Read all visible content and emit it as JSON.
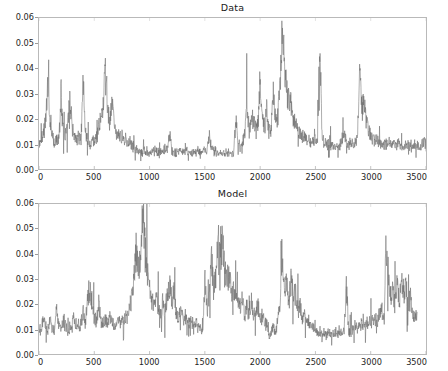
{
  "figure": {
    "background": "#ffffff",
    "line_color": "#6a6a6a",
    "axis_color": "#b9b9b9",
    "tick_label_color": "#232323"
  },
  "chart_data": [
    {
      "type": "line",
      "title": "Data",
      "xlabel": "",
      "ylabel": "",
      "xlim": [
        0,
        3500
      ],
      "ylim": [
        0.0,
        0.06
      ],
      "grid": false,
      "legend": "none",
      "xticks": [
        0,
        500,
        1000,
        1500,
        2000,
        2500,
        3000,
        3500
      ],
      "xtick_labels": [
        "0",
        "500",
        "1000",
        "1500",
        "2000",
        "2500",
        "3000",
        "3500"
      ],
      "yticks": [
        0.0,
        0.01,
        0.02,
        0.03,
        0.04,
        0.05,
        0.06
      ],
      "ytick_labels": [
        "0.00",
        "0.01",
        "0.02",
        "0.03",
        "0.04",
        "0.05",
        "0.06"
      ],
      "series": [
        {
          "name": "Data",
          "color": "#6a6a6a",
          "x": [
            0,
            20,
            40,
            60,
            80,
            100,
            120,
            140,
            160,
            180,
            200,
            220,
            240,
            260,
            280,
            300,
            320,
            340,
            360,
            380,
            400,
            420,
            440,
            460,
            480,
            500,
            520,
            540,
            560,
            580,
            600,
            620,
            640,
            660,
            680,
            700,
            720,
            740,
            760,
            780,
            800,
            820,
            840,
            860,
            880,
            900,
            920,
            940,
            960,
            980,
            1000,
            1020,
            1040,
            1060,
            1080,
            1100,
            1120,
            1140,
            1160,
            1180,
            1200,
            1220,
            1240,
            1260,
            1280,
            1300,
            1320,
            1340,
            1360,
            1380,
            1400,
            1420,
            1440,
            1460,
            1480,
            1500,
            1520,
            1540,
            1560,
            1580,
            1600,
            1620,
            1640,
            1660,
            1680,
            1700,
            1720,
            1740,
            1760,
            1780,
            1800,
            1820,
            1840,
            1860,
            1880,
            1900,
            1920,
            1940,
            1960,
            1980,
            2000,
            2020,
            2040,
            2060,
            2080,
            2100,
            2120,
            2140,
            2160,
            2180,
            2200,
            2220,
            2240,
            2260,
            2280,
            2300,
            2320,
            2340,
            2360,
            2380,
            2400,
            2420,
            2440,
            2460,
            2480,
            2500,
            2520,
            2540,
            2560,
            2580,
            2600,
            2620,
            2640,
            2660,
            2680,
            2700,
            2720,
            2740,
            2760,
            2780,
            2800,
            2820,
            2840,
            2860,
            2880,
            2900,
            2920,
            2940,
            2960,
            2980,
            3000,
            3020,
            3040,
            3060,
            3080,
            3100,
            3120,
            3140,
            3160,
            3180,
            3200,
            3220,
            3240,
            3260,
            3280,
            3300,
            3320,
            3340,
            3360,
            3380,
            3400,
            3420,
            3440,
            3460,
            3480,
            3500
          ],
          "y": [
            0.0095,
            0.011,
            0.0145,
            0.019,
            0.0335,
            0.02,
            0.013,
            0.0105,
            0.0115,
            0.012,
            0.03,
            0.015,
            0.0135,
            0.0185,
            0.03,
            0.0175,
            0.0135,
            0.012,
            0.0125,
            0.0115,
            0.034,
            0.014,
            0.011,
            0.0105,
            0.0115,
            0.0118,
            0.0125,
            0.016,
            0.0215,
            0.026,
            0.038,
            0.0245,
            0.0195,
            0.026,
            0.0175,
            0.015,
            0.014,
            0.013,
            0.0125,
            0.012,
            0.011,
            0.0105,
            0.01,
            0.0085,
            0.0078,
            0.0072,
            0.007,
            0.0068,
            0.0072,
            0.007,
            0.0068,
            0.0072,
            0.0075,
            0.007,
            0.0068,
            0.007,
            0.0075,
            0.008,
            0.0072,
            0.014,
            0.0078,
            0.007,
            0.0068,
            0.0072,
            0.007,
            0.0068,
            0.0072,
            0.0075,
            0.007,
            0.0065,
            0.0068,
            0.007,
            0.0072,
            0.0068,
            0.007,
            0.0075,
            0.008,
            0.013,
            0.0085,
            0.0072,
            0.0068,
            0.0065,
            0.0062,
            0.006,
            0.0062,
            0.0065,
            0.0062,
            0.006,
            0.0058,
            0.02,
            0.0095,
            0.009,
            0.011,
            0.014,
            0.0255,
            0.016,
            0.018,
            0.021,
            0.015,
            0.0175,
            0.0355,
            0.0195,
            0.016,
            0.023,
            0.015,
            0.017,
            0.03,
            0.0185,
            0.021,
            0.033,
            0.057,
            0.039,
            0.031,
            0.028,
            0.0255,
            0.02,
            0.0175,
            0.0155,
            0.014,
            0.013,
            0.0125,
            0.012,
            0.0115,
            0.011,
            0.0105,
            0.0115,
            0.011,
            0.052,
            0.012,
            0.0105,
            0.01,
            0.0098,
            0.0095,
            0.0092,
            0.009,
            0.0095,
            0.0092,
            0.01,
            0.015,
            0.0105,
            0.01,
            0.0098,
            0.01,
            0.0105,
            0.014,
            0.039,
            0.024,
            0.026,
            0.018,
            0.015,
            0.0135,
            0.0125,
            0.0118,
            0.011,
            0.0105,
            0.01,
            0.0098,
            0.01,
            0.0105,
            0.0098,
            0.0095,
            0.01,
            0.0098,
            0.0095,
            0.0092,
            0.009,
            0.0095,
            0.0098,
            0.0092,
            0.009,
            0.0095,
            0.0092,
            0.009,
            0.0095,
            0.01,
            0.011
          ]
        }
      ]
    },
    {
      "type": "line",
      "title": "Model",
      "xlabel": "",
      "ylabel": "",
      "xlim": [
        0,
        3500
      ],
      "ylim": [
        0.0,
        0.06
      ],
      "grid": false,
      "legend": "none",
      "xticks": [
        0,
        500,
        1000,
        1500,
        2000,
        2500,
        3000,
        3500
      ],
      "xtick_labels": [
        "0",
        "500",
        "1000",
        "1500",
        "2000",
        "2500",
        "3000",
        "3500"
      ],
      "yticks": [
        0.0,
        0.01,
        0.02,
        0.03,
        0.04,
        0.05,
        0.06
      ],
      "ytick_labels": [
        "0.00",
        "0.01",
        "0.02",
        "0.03",
        "0.04",
        "0.05",
        "0.06"
      ],
      "series": [
        {
          "name": "Model",
          "color": "#6a6a6a",
          "x": [
            0,
            20,
            40,
            60,
            80,
            100,
            120,
            140,
            160,
            180,
            200,
            220,
            240,
            260,
            280,
            300,
            320,
            340,
            360,
            380,
            400,
            420,
            440,
            460,
            480,
            500,
            520,
            540,
            560,
            580,
            600,
            620,
            640,
            660,
            680,
            700,
            720,
            740,
            760,
            780,
            800,
            820,
            840,
            860,
            880,
            900,
            920,
            940,
            960,
            980,
            1000,
            1020,
            1040,
            1060,
            1080,
            1100,
            1120,
            1140,
            1160,
            1180,
            1200,
            1220,
            1240,
            1260,
            1280,
            1300,
            1320,
            1340,
            1360,
            1380,
            1400,
            1420,
            1440,
            1460,
            1480,
            1500,
            1520,
            1540,
            1560,
            1580,
            1600,
            1620,
            1640,
            1660,
            1680,
            1700,
            1720,
            1740,
            1760,
            1780,
            1800,
            1820,
            1840,
            1860,
            1880,
            1900,
            1920,
            1940,
            1960,
            1980,
            2000,
            2020,
            2040,
            2060,
            2080,
            2100,
            2120,
            2140,
            2160,
            2180,
            2200,
            2220,
            2240,
            2260,
            2280,
            2300,
            2320,
            2340,
            2360,
            2380,
            2400,
            2420,
            2440,
            2460,
            2480,
            2500,
            2520,
            2540,
            2560,
            2580,
            2600,
            2620,
            2640,
            2660,
            2680,
            2700,
            2720,
            2740,
            2760,
            2780,
            2800,
            2820,
            2840,
            2860,
            2880,
            2900,
            2920,
            2940,
            2960,
            2980,
            3000,
            3020,
            3040,
            3060,
            3080,
            3100,
            3120,
            3140,
            3160,
            3180,
            3200,
            3220,
            3240,
            3260,
            3280,
            3300,
            3320,
            3340,
            3360,
            3380,
            3400,
            3420,
            3440,
            3460,
            3480,
            3500
          ],
          "y": [
            0.009,
            0.0105,
            0.015,
            0.011,
            0.0095,
            0.014,
            0.0105,
            0.009,
            0.0175,
            0.012,
            0.01,
            0.013,
            0.011,
            0.0095,
            0.0105,
            0.0115,
            0.015,
            0.011,
            0.0095,
            0.013,
            0.016,
            0.012,
            0.023,
            0.027,
            0.0195,
            0.0155,
            0.013,
            0.02,
            0.014,
            0.012,
            0.0135,
            0.0115,
            0.0145,
            0.0125,
            0.011,
            0.012,
            0.0135,
            0.0115,
            0.013,
            0.0155,
            0.014,
            0.0175,
            0.023,
            0.031,
            0.042,
            0.033,
            0.038,
            0.0565,
            0.042,
            0.033,
            0.026,
            0.022,
            0.019,
            0.023,
            0.0175,
            0.0155,
            0.02,
            0.0165,
            0.023,
            0.029,
            0.0195,
            0.0245,
            0.017,
            0.015,
            0.019,
            0.014,
            0.016,
            0.013,
            0.0115,
            0.014,
            0.0105,
            0.0125,
            0.0095,
            0.011,
            0.008,
            0.029,
            0.0175,
            0.023,
            0.038,
            0.025,
            0.033,
            0.057,
            0.042,
            0.046,
            0.033,
            0.029,
            0.031,
            0.025,
            0.028,
            0.022,
            0.024,
            0.0185,
            0.021,
            0.016,
            0.019,
            0.015,
            0.023,
            0.017,
            0.0145,
            0.02,
            0.013,
            0.0155,
            0.011,
            0.0125,
            0.006,
            0.009,
            0.0115,
            0.0085,
            0.014,
            0.019,
            0.0425,
            0.023,
            0.029,
            0.018,
            0.033,
            0.0215,
            0.025,
            0.0165,
            0.0195,
            0.014,
            0.016,
            0.012,
            0.0135,
            0.0105,
            0.0115,
            0.009,
            0.0085,
            0.0095,
            0.0075,
            0.0085,
            0.007,
            0.0095,
            0.008,
            0.0075,
            0.009,
            0.0085,
            0.0095,
            0.008,
            0.009,
            0.0275,
            0.0095,
            0.0085,
            0.01,
            0.0115,
            0.0095,
            0.011,
            0.0125,
            0.0105,
            0.012,
            0.0135,
            0.0115,
            0.013,
            0.0145,
            0.0125,
            0.016,
            0.0175,
            0.015,
            0.044,
            0.031,
            0.023,
            0.026,
            0.0195,
            0.028,
            0.0215,
            0.03,
            0.024,
            0.0265,
            0.02,
            0.023,
            0.0175,
            0.016,
            0.014
          ]
        }
      ]
    }
  ]
}
